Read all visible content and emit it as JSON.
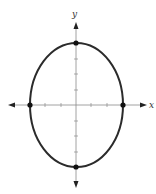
{
  "diagram": {
    "type": "ellipse-graph",
    "axes": {
      "x_label": "x",
      "y_label": "y"
    },
    "ellipse": {
      "center": [
        0,
        0
      ],
      "semi_axis_x": 3,
      "semi_axis_y": 4,
      "equation": "x^2/9 + y^2/16 = 1"
    },
    "vertices": [
      {
        "name": "left",
        "x": -3,
        "y": 0
      },
      {
        "name": "right",
        "x": 3,
        "y": 0
      },
      {
        "name": "top",
        "x": 0,
        "y": 4
      },
      {
        "name": "bottom",
        "x": 0,
        "y": -4
      }
    ],
    "x_ticks": [
      -2,
      -1,
      1,
      2
    ],
    "y_ticks": [
      -3,
      -2,
      -1,
      1,
      2,
      3
    ],
    "colors": {
      "curve": "#2b2b2b",
      "axes": "#7a7a7a",
      "points": "#111111"
    }
  }
}
